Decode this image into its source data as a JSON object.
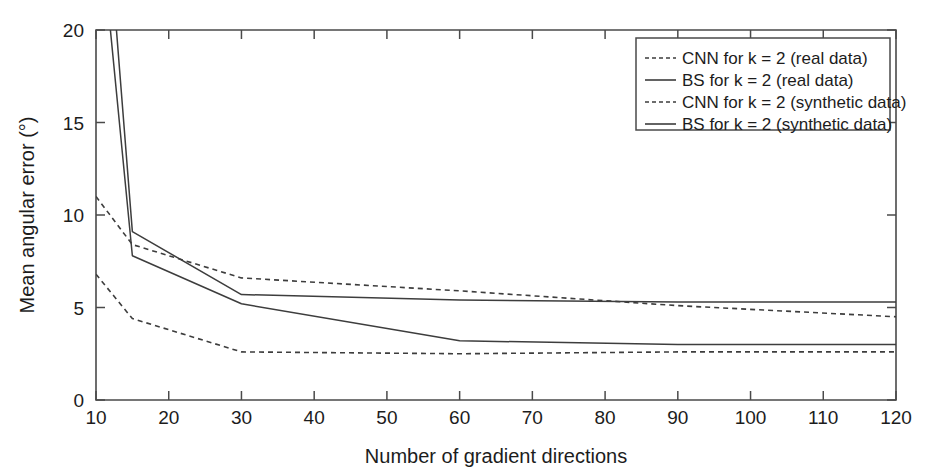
{
  "chart_data": {
    "type": "line",
    "title": "",
    "xlabel": "Number of gradient directions",
    "ylabel": "Mean angular error (°)",
    "xlim": [
      10,
      120
    ],
    "ylim": [
      0,
      20
    ],
    "xticks": [
      10,
      20,
      30,
      40,
      50,
      60,
      70,
      80,
      90,
      100,
      110,
      120
    ],
    "yticks": [
      0,
      5,
      10,
      15,
      20
    ],
    "xtick_labels": [
      "10",
      "20",
      "30",
      "40",
      "50",
      "60",
      "70",
      "80",
      "90",
      "100",
      "110",
      "120"
    ],
    "ytick_labels": [
      "0",
      "5",
      "10",
      "15",
      "20"
    ],
    "grid": false,
    "legend_position": "top-right",
    "x": [
      10,
      15,
      30,
      60,
      90,
      120
    ],
    "series": [
      {
        "name": "CNN for k = 2 (real data)",
        "style": "dashed",
        "values": [
          11.0,
          8.4,
          6.6,
          5.9,
          5.1,
          4.5
        ]
      },
      {
        "name": "BS for k = 2 (real data)",
        "style": "solid",
        "values": [
          34.0,
          9.1,
          5.7,
          5.4,
          5.3,
          5.3
        ]
      },
      {
        "name": "CNN for k = 2 (synthetic data)",
        "style": "dashed",
        "values": [
          6.8,
          4.4,
          2.6,
          2.5,
          2.6,
          2.6
        ]
      },
      {
        "name": "BS for k = 2 (synthetic data)",
        "style": "solid",
        "values": [
          28.0,
          7.8,
          5.2,
          3.2,
          3.0,
          3.0
        ]
      }
    ]
  },
  "legend": {
    "entries": [
      {
        "label": "CNN for k = 2 (real data)",
        "style": "dashed"
      },
      {
        "label": "BS for k = 2 (real data)",
        "style": "solid"
      },
      {
        "label": "CNN for k = 2 (synthetic data)",
        "style": "dashed"
      },
      {
        "label": "BS for k = 2 (synthetic data)",
        "style": "solid"
      }
    ]
  }
}
